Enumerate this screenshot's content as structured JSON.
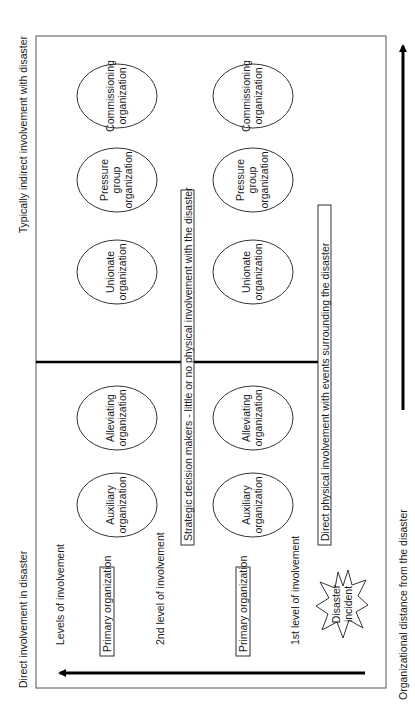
{
  "diagram": {
    "orientation": "rotated -90deg (reads bottom-to-top)",
    "axes": {
      "vertical_left_label": "Direct involvement in disaster",
      "vertical_right_label": "Typically indirect involvement with disaster",
      "horizontal_label": "Organizational distance from the disaster"
    },
    "levels_heading": "Levels of involvement",
    "level_2_label": "2nd level of involvement",
    "level_1_label": "1st level of involvement",
    "level_2_primary": "Primary organization",
    "level_1_primary": "Primary organization",
    "level_2_banner": "Strategic decision makers - little or no physical involvement with the disaster",
    "level_1_banner": "Direct physical involvement with events surrounding the disaster",
    "disaster": {
      "line1": "Disaster",
      "line2": "incident"
    },
    "row2_orgs": [
      {
        "line1": "Auxiliary",
        "line2": "organization",
        "line3": ""
      },
      {
        "line1": "Alleviating",
        "line2": "organization",
        "line3": ""
      },
      {
        "line1": "Unionate",
        "line2": "organization",
        "line3": ""
      },
      {
        "line1": "Pressure",
        "line2": "group",
        "line3": "organization"
      },
      {
        "line1": "Commissioning",
        "line2": "organization",
        "line3": ""
      }
    ],
    "row1_orgs": [
      {
        "line1": "Auxiliary",
        "line2": "organization",
        "line3": ""
      },
      {
        "line1": "Alleviating",
        "line2": "organization",
        "line3": ""
      },
      {
        "line1": "Unionate",
        "line2": "organization",
        "line3": ""
      },
      {
        "line1": "Pressure",
        "line2": "group",
        "line3": "organization"
      },
      {
        "line1": "Commissioning",
        "line2": "organization",
        "line3": ""
      }
    ]
  }
}
